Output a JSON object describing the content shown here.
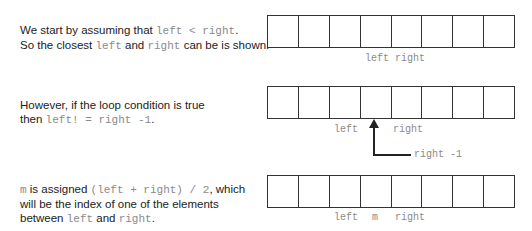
{
  "rows": [
    {
      "text": {
        "line1": [
          "We start by assuming that ",
          "left < right",
          "."
        ],
        "line2": [
          "So the closest ",
          "left",
          " and ",
          "right",
          " can be is shown."
        ]
      },
      "array_cells": 8,
      "labels": [
        {
          "text": "left",
          "x": 365,
          "y": 53
        },
        {
          "text": "right",
          "x": 395,
          "y": 53
        }
      ]
    },
    {
      "text": {
        "line1": [
          "However, if the loop condition is true"
        ],
        "line2": [
          "then ",
          "left! = right -1",
          "."
        ]
      },
      "array_cells": 8,
      "labels": [
        {
          "text": "left",
          "x": 334,
          "y": 124
        },
        {
          "text": "right",
          "x": 393,
          "y": 124
        },
        {
          "text": "right -1",
          "x": 414,
          "y": 149
        }
      ]
    },
    {
      "text": {
        "line1": [
          "m",
          " is assigned ",
          "(left + right) / 2",
          ", which"
        ],
        "line2": [
          "will be the index of one of the elements"
        ],
        "line3": [
          "between ",
          "left",
          " and ",
          "right",
          "."
        ]
      },
      "array_cells": 8,
      "labels": [
        {
          "text": "left",
          "x": 334,
          "y": 212
        },
        {
          "text": "m",
          "x": 372,
          "y": 212
        },
        {
          "text": "right",
          "x": 395,
          "y": 212
        }
      ]
    }
  ]
}
